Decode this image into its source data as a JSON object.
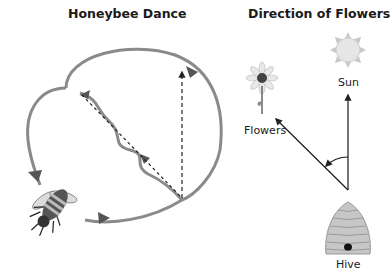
{
  "left_panel": {
    "title": "Honeybee Dance",
    "elements": [
      "waggle-path",
      "return-loop-left",
      "return-loop-right",
      "gravity-reference-line",
      "honeybee"
    ]
  },
  "right_panel": {
    "title": "Direction of Flowers",
    "labels": {
      "sun": "Sun",
      "flowers": "Flowers",
      "hive": "Hive"
    }
  },
  "colors": {
    "loop": "#8a8a8a",
    "arrow": "#333333",
    "line": "#1a1a1a"
  }
}
